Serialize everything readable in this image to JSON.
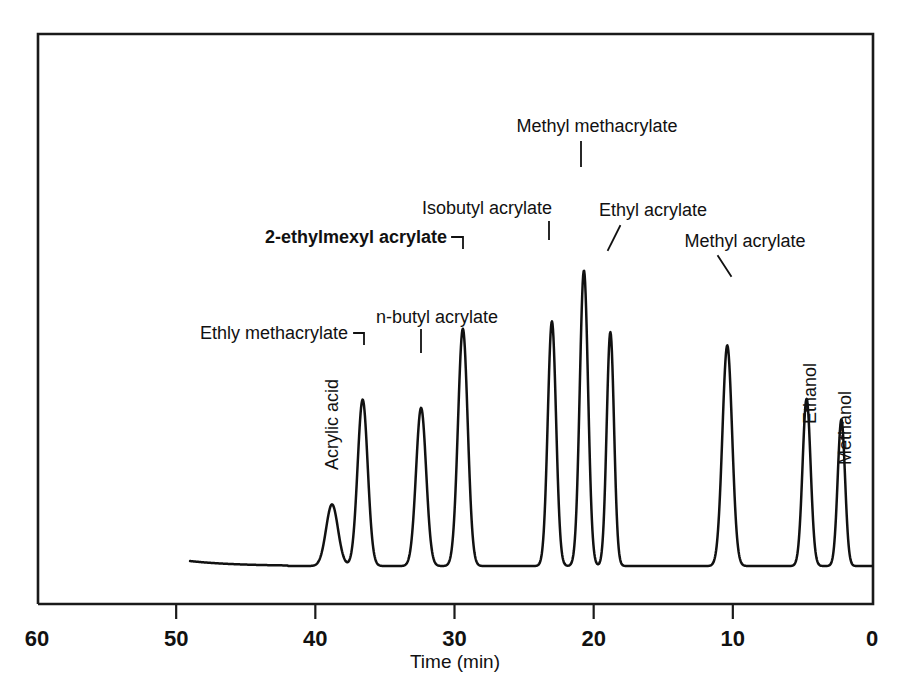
{
  "figure": {
    "kind": "gas-chromatogram",
    "background_color": "#ffffff",
    "ink_color": "#111111"
  },
  "axis": {
    "title": "Time (min)",
    "tick_labels": [
      "60",
      "50",
      "40",
      "30",
      "20",
      "10",
      "0"
    ],
    "tick_values": [
      60,
      50,
      40,
      30,
      20,
      10,
      0
    ]
  },
  "chart_data": {
    "type": "line",
    "title": "",
    "subtitle": "",
    "xlabel": "Time (min)",
    "ylabel": "",
    "xlim": [
      60,
      0
    ],
    "ylim": [
      0,
      1
    ],
    "x_axis_reversed": true,
    "grid": false,
    "legend": "none",
    "xticks": [
      60,
      50,
      40,
      30,
      20,
      10,
      0
    ],
    "xtick_labels": [
      "60",
      "50",
      "40",
      "30",
      "20",
      "10",
      "0"
    ],
    "baseline_start_time": 49.0,
    "annotations": [
      "Acrylic acid",
      "Ethly methacrylate",
      "n-butyl acrylate",
      "2-ethylmexyl acrylate",
      "Isobutyl acrylate",
      "Methyl methacrylate",
      "Ethyl acrylate",
      "Methyl acrylate",
      "Ethanol",
      "Methanol"
    ],
    "peaks": [
      {
        "name": "Acrylic acid",
        "retention_time": 38.8,
        "height": 0.149,
        "width": 1.0
      },
      {
        "name": "Ethly methacrylate",
        "retention_time": 36.6,
        "height": 0.402,
        "width": 0.85
      },
      {
        "name": "n-butyl acrylate",
        "retention_time": 32.4,
        "height": 0.382,
        "width": 0.85
      },
      {
        "name": "2-ethylmexyl acrylate",
        "retention_time": 29.4,
        "height": 0.573,
        "width": 0.82
      },
      {
        "name": "Isobutyl acrylate",
        "retention_time": 23.0,
        "height": 0.591,
        "width": 0.7
      },
      {
        "name": "Methyl methacrylate",
        "retention_time": 20.7,
        "height": 0.714,
        "width": 0.7
      },
      {
        "name": "Ethyl acrylate",
        "retention_time": 18.8,
        "height": 0.565,
        "width": 0.62
      },
      {
        "name": "Methyl acrylate",
        "retention_time": 10.4,
        "height": 0.533,
        "width": 0.82
      },
      {
        "name": "Ethanol",
        "retention_time": 4.7,
        "height": 0.404,
        "width": 0.68
      },
      {
        "name": "Methanol",
        "retention_time": 2.2,
        "height": 0.354,
        "width": 0.62
      }
    ]
  },
  "peak_labels": [
    {
      "id": "acrylic-acid",
      "text": "Acrylic acid",
      "orientation": "vertical",
      "bold": false,
      "x": 338,
      "y": 470,
      "leader": null
    },
    {
      "id": "ethly-methacrylate",
      "text": "Ethly methacrylate",
      "orientation": "horizontal",
      "bold": false,
      "anchor": "end",
      "x": 348,
      "y": 339,
      "leader": "M 354 333 L 364 333 L 364 344"
    },
    {
      "id": "n-butyl-acrylate",
      "text": "n-butyl acrylate",
      "orientation": "horizontal",
      "bold": false,
      "anchor": "start",
      "x": 376,
      "y": 323,
      "leader": "M 421 330 L 421 352"
    },
    {
      "id": "2-ethylmexyl-acrylate",
      "text": "2-ethylmexyl acrylate",
      "orientation": "horizontal",
      "bold": true,
      "anchor": "end",
      "x": 447,
      "y": 243,
      "leader": "M 452 237 L 463 237 L 463 248"
    },
    {
      "id": "isobutyl-acrylate",
      "text": "Isobutyl acrylate",
      "orientation": "horizontal",
      "bold": false,
      "anchor": "middle",
      "x": 487,
      "y": 214,
      "leader": "M 549 222 L 549 239"
    },
    {
      "id": "methyl-methacrylate",
      "text": "Methyl methacrylate",
      "orientation": "horizontal",
      "bold": false,
      "anchor": "middle",
      "x": 597,
      "y": 132,
      "leader": "M 581 142 L 581 166"
    },
    {
      "id": "ethyl-acrylate",
      "text": "Ethyl acrylate",
      "orientation": "horizontal",
      "bold": false,
      "anchor": "middle",
      "x": 653,
      "y": 216,
      "leader": "M 620 226 L 608 250"
    },
    {
      "id": "methyl-acrylate",
      "text": "Methyl acrylate",
      "orientation": "horizontal",
      "bold": false,
      "anchor": "middle",
      "x": 745,
      "y": 247,
      "leader": "M 718 256 L 731 276"
    },
    {
      "id": "ethanol",
      "text": "Ethanol",
      "orientation": "vertical",
      "bold": false,
      "x": 816,
      "y": 424,
      "leader": null
    },
    {
      "id": "methanol",
      "text": "Methanol",
      "orientation": "vertical",
      "bold": false,
      "x": 851,
      "y": 465,
      "leader": null
    }
  ]
}
